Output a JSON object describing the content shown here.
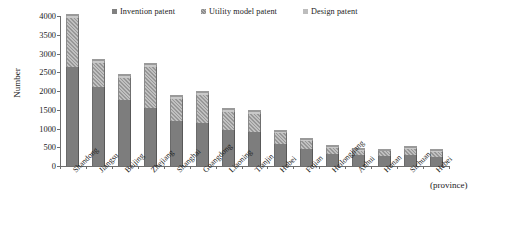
{
  "chart_data": {
    "type": "bar",
    "subtype": "stacked-bar",
    "title": "",
    "xlabel": "(province)",
    "ylabel": "Number",
    "ylim": [
      0,
      4000
    ],
    "ytick_step": 500,
    "yticks": [
      "4000",
      "3500",
      "3000",
      "2500",
      "2000",
      "1500",
      "1000",
      "500",
      "0"
    ],
    "grid": false,
    "legend_position": "top",
    "categories": [
      "Shandong",
      "Jiangsu",
      "Beijing",
      "Zhejiang",
      "Shanghai",
      "Guangdong",
      "Liaoning",
      "Tianjin",
      "Hubei",
      "Fujian",
      "Heilongjiang",
      "Anhui",
      "Hunan",
      "Sichuan",
      "Hebei"
    ],
    "series": [
      {
        "name": "Invention patent",
        "color": "#7d7d7d",
        "values": [
          2650,
          2100,
          1750,
          1550,
          1200,
          1150,
          950,
          900,
          600,
          450,
          330,
          290,
          270,
          300,
          250
        ]
      },
      {
        "name": "Utility model patent",
        "color": "#a6a6a6",
        "values": [
          1300,
          650,
          600,
          1100,
          600,
          750,
          500,
          500,
          280,
          220,
          150,
          110,
          120,
          150,
          130
        ]
      },
      {
        "name": "Design patent",
        "color": "#c9c9c9",
        "values": [
          50,
          50,
          50,
          50,
          50,
          50,
          50,
          50,
          20,
          30,
          20,
          20,
          20,
          20,
          20
        ]
      }
    ],
    "totals": [
      4000,
      2800,
      2400,
      2700,
      1850,
      1950,
      1500,
      1450,
      900,
      700,
      500,
      420,
      410,
      470,
      400
    ]
  },
  "legend": {
    "items": [
      {
        "label": "Invention patent",
        "swatch": "invention-swatch"
      },
      {
        "label": "Utility model patent",
        "swatch": "utility-swatch"
      },
      {
        "label": "Design patent",
        "swatch": "design-swatch"
      }
    ]
  },
  "axes": {
    "y_title": "Number",
    "x_unit": "(province)"
  }
}
